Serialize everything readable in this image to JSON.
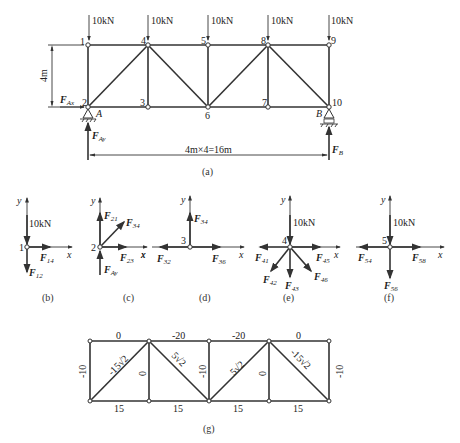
{
  "figure_a": {
    "caption": "(a)",
    "loads": [
      "10kN",
      "10kN",
      "10kN",
      "10kN",
      "10kN"
    ],
    "top_nodes": [
      "1",
      "4",
      "5",
      "8",
      "9"
    ],
    "bottom_nodes": [
      "2",
      "3",
      "6",
      "7",
      "10"
    ],
    "height_dim": "4m",
    "span_dim": "4m×4=16m",
    "support_A": "A",
    "support_B": "B",
    "reaction_Ax": "F",
    "reaction_Ax_sub": "Ax",
    "reaction_Ay": "F",
    "reaction_Ay_sub": "Ay",
    "reaction_B": "F",
    "reaction_B_sub": "B"
  },
  "figure_b": {
    "caption": "(b)",
    "node": "1",
    "load": "10kN",
    "x": "x",
    "y": "y",
    "f1": "F",
    "f1_sub": "14",
    "f2": "F",
    "f2_sub": "12"
  },
  "figure_c": {
    "caption": "(c)",
    "node": "2",
    "x": "x",
    "y": "y",
    "f1": "F",
    "f1_sub": "21",
    "f2": "F",
    "f2_sub": "34",
    "f3": "F",
    "f3_sub": "23",
    "f4": "F",
    "f4_sub": "Ay"
  },
  "figure_d": {
    "caption": "(d)",
    "node": "3",
    "x": "x",
    "y": "y",
    "f1": "F",
    "f1_sub": "34",
    "f2": "F",
    "f2_sub": "32",
    "f3": "F",
    "f3_sub": "36"
  },
  "figure_e": {
    "caption": "(e)",
    "node": "4",
    "load": "10kN",
    "x": "x",
    "y": "y",
    "f1": "F",
    "f1_sub": "41",
    "f2": "F",
    "f2_sub": "45",
    "f3": "F",
    "f3_sub": "42",
    "f4": "F",
    "f4_sub": "43",
    "f5": "F",
    "f5_sub": "46"
  },
  "figure_f": {
    "caption": "(f)",
    "node": "5",
    "load": "10kN",
    "x": "x",
    "y": "y",
    "f1": "F",
    "f1_sub": "54",
    "f2": "F",
    "f2_sub": "58",
    "f3": "F",
    "f3_sub": "56"
  },
  "figure_g": {
    "caption": "(g)",
    "top_chord": [
      "0",
      "-20",
      "-20",
      "0"
    ],
    "bottom_chord": [
      "15",
      "15",
      "15",
      "15"
    ],
    "verticals": [
      "-10",
      "0",
      "-10",
      "0",
      "-10"
    ],
    "diagonals": [
      "-15√2",
      "5√2",
      "5√2",
      "-15√2"
    ]
  }
}
